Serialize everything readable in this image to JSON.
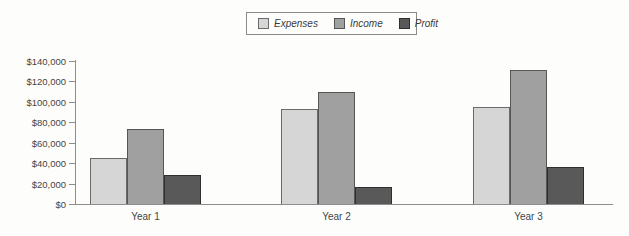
{
  "chart_data": {
    "type": "bar",
    "title": "",
    "xlabel": "",
    "ylabel": "",
    "categories": [
      "Year 1",
      "Year 2",
      "Year 3"
    ],
    "series": [
      {
        "name": "Expenses",
        "values": [
          45000,
          93000,
          95000
        ],
        "fill": "#d6d6d6",
        "border": "#6a6a6a"
      },
      {
        "name": "Income",
        "values": [
          73000,
          110000,
          131000
        ],
        "fill": "#a0a0a0",
        "border": "#565656"
      },
      {
        "name": "Profit",
        "values": [
          28000,
          17000,
          36000
        ],
        "fill": "#595959",
        "border": "#2f2f2f"
      }
    ],
    "ylim": [
      0,
      140000
    ],
    "ytick_step": 20000,
    "ytick_labels": [
      "$0",
      "$20,000",
      "$40,000",
      "$60,000",
      "$80,000",
      "$100,000",
      "$120,000",
      "$140,000"
    ],
    "grid": false,
    "legend_position": "top-center",
    "colors": {
      "axis": "#8d8d8d",
      "text": "#454545",
      "background": "#fdfdfc"
    }
  }
}
